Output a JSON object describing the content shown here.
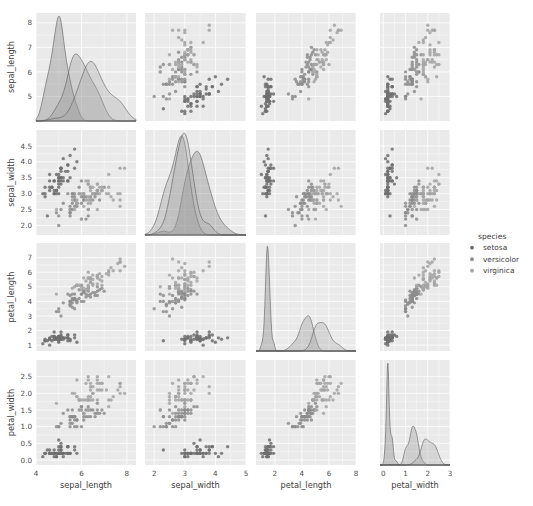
{
  "figure": {
    "type": "pairplot",
    "background": "#ffffff",
    "panel_background": "#eaeaea",
    "grid_color": "#ffffff"
  },
  "legend": {
    "title": "species",
    "position": "right",
    "entries": [
      {
        "label": "setosa",
        "color": "#6e6e6e",
        "marker": "circle"
      },
      {
        "label": "versicolor",
        "color": "#8c8c8c",
        "marker": "circle"
      },
      {
        "label": "virginica",
        "color": "#a3a3a3",
        "marker": "circle"
      }
    ]
  },
  "chart_data": {
    "type": "scatter",
    "title": "",
    "subtitle": "",
    "variables": [
      "sepal_length",
      "sepal_width",
      "petal_length",
      "petal_width"
    ],
    "grid": true,
    "diagonal": "kde",
    "offdiagonal": "scatter",
    "groupby": "species",
    "groups": [
      "setosa",
      "versicolor",
      "virginica"
    ],
    "group_colors": [
      "#6e6e6e",
      "#8c8c8c",
      "#a3a3a3"
    ],
    "axes": {
      "sepal_length": {
        "label": "sepal_length",
        "lim": [
          4.0,
          8.4
        ],
        "ticks": [
          4,
          6,
          8
        ],
        "tick_labels": [
          "4",
          "6",
          "8"
        ],
        "y_ticks": [
          5,
          6,
          7,
          8
        ],
        "y_tick_labels": [
          "5",
          "6",
          "7",
          "8"
        ]
      },
      "sepal_width": {
        "label": "sepal_width",
        "lim": [
          1.7,
          5.0
        ],
        "ticks": [
          2,
          3,
          4,
          5
        ],
        "tick_labels": [
          "2",
          "3",
          "4",
          "5"
        ],
        "y_ticks": [
          2.0,
          2.5,
          3.0,
          3.5,
          4.0,
          4.5
        ],
        "y_tick_labels": [
          "2.0",
          "2.5",
          "3.0",
          "3.5",
          "4.0",
          "4.5"
        ]
      },
      "petal_length": {
        "label": "petal_length",
        "lim": [
          0.6,
          8.0
        ],
        "ticks": [
          2,
          4,
          6,
          8
        ],
        "tick_labels": [
          "2",
          "4",
          "6",
          "8"
        ],
        "y_ticks": [
          1,
          2,
          3,
          4,
          5,
          6,
          7
        ],
        "y_tick_labels": [
          "1",
          "2",
          "3",
          "4",
          "5",
          "6",
          "7"
        ]
      },
      "petal_width": {
        "label": "petal_width",
        "lim": [
          -0.15,
          3.0
        ],
        "ticks": [
          0,
          1,
          2,
          3
        ],
        "tick_labels": [
          "0",
          "1",
          "2",
          "3"
        ],
        "y_ticks": [
          0.0,
          0.5,
          1.0,
          1.5,
          2.0,
          2.5
        ],
        "y_tick_labels": [
          "0.0",
          "0.5",
          "1.0",
          "1.5",
          "2.0",
          "2.5"
        ]
      }
    },
    "xlabel": "",
    "ylabel": "",
    "points": {
      "setosa": [
        [
          5.1,
          3.5,
          1.4,
          0.2
        ],
        [
          4.9,
          3.0,
          1.4,
          0.2
        ],
        [
          4.7,
          3.2,
          1.3,
          0.2
        ],
        [
          4.6,
          3.1,
          1.5,
          0.2
        ],
        [
          5.0,
          3.6,
          1.4,
          0.2
        ],
        [
          5.4,
          3.9,
          1.7,
          0.4
        ],
        [
          4.6,
          3.4,
          1.4,
          0.3
        ],
        [
          5.0,
          3.4,
          1.5,
          0.2
        ],
        [
          4.4,
          2.9,
          1.4,
          0.2
        ],
        [
          4.9,
          3.1,
          1.5,
          0.1
        ],
        [
          5.4,
          3.7,
          1.5,
          0.2
        ],
        [
          4.8,
          3.4,
          1.6,
          0.2
        ],
        [
          4.8,
          3.0,
          1.4,
          0.1
        ],
        [
          4.3,
          3.0,
          1.1,
          0.1
        ],
        [
          5.8,
          4.0,
          1.2,
          0.2
        ],
        [
          5.7,
          4.4,
          1.5,
          0.4
        ],
        [
          5.4,
          3.9,
          1.3,
          0.4
        ],
        [
          5.1,
          3.5,
          1.4,
          0.3
        ],
        [
          5.7,
          3.8,
          1.7,
          0.3
        ],
        [
          5.1,
          3.8,
          1.5,
          0.3
        ],
        [
          5.4,
          3.4,
          1.7,
          0.2
        ],
        [
          5.1,
          3.7,
          1.5,
          0.4
        ],
        [
          4.6,
          3.6,
          1.0,
          0.2
        ],
        [
          5.1,
          3.3,
          1.7,
          0.5
        ],
        [
          4.8,
          3.4,
          1.9,
          0.2
        ],
        [
          5.0,
          3.0,
          1.6,
          0.2
        ],
        [
          5.0,
          3.4,
          1.6,
          0.4
        ],
        [
          5.2,
          3.5,
          1.5,
          0.2
        ],
        [
          5.2,
          3.4,
          1.4,
          0.2
        ],
        [
          4.7,
          3.2,
          1.6,
          0.2
        ],
        [
          4.8,
          3.1,
          1.6,
          0.2
        ],
        [
          5.4,
          3.4,
          1.5,
          0.4
        ],
        [
          5.2,
          4.1,
          1.5,
          0.1
        ],
        [
          5.5,
          4.2,
          1.4,
          0.2
        ],
        [
          4.9,
          3.1,
          1.5,
          0.2
        ],
        [
          5.0,
          3.2,
          1.2,
          0.2
        ],
        [
          5.5,
          3.5,
          1.3,
          0.2
        ],
        [
          4.9,
          3.6,
          1.4,
          0.1
        ],
        [
          4.4,
          3.0,
          1.3,
          0.2
        ],
        [
          5.1,
          3.4,
          1.5,
          0.2
        ],
        [
          5.0,
          3.5,
          1.3,
          0.3
        ],
        [
          4.5,
          2.3,
          1.3,
          0.3
        ],
        [
          4.4,
          3.2,
          1.3,
          0.2
        ],
        [
          5.0,
          3.5,
          1.6,
          0.6
        ],
        [
          5.1,
          3.8,
          1.9,
          0.4
        ],
        [
          4.8,
          3.0,
          1.4,
          0.3
        ],
        [
          5.1,
          3.8,
          1.6,
          0.2
        ],
        [
          4.6,
          3.2,
          1.4,
          0.2
        ],
        [
          5.3,
          3.7,
          1.5,
          0.2
        ],
        [
          5.0,
          3.3,
          1.4,
          0.2
        ]
      ],
      "versicolor": [
        [
          7.0,
          3.2,
          4.7,
          1.4
        ],
        [
          6.4,
          3.2,
          4.5,
          1.5
        ],
        [
          6.9,
          3.1,
          4.9,
          1.5
        ],
        [
          5.5,
          2.3,
          4.0,
          1.3
        ],
        [
          6.5,
          2.8,
          4.6,
          1.5
        ],
        [
          5.7,
          2.8,
          4.5,
          1.3
        ],
        [
          6.3,
          3.3,
          4.7,
          1.6
        ],
        [
          4.9,
          2.4,
          3.3,
          1.0
        ],
        [
          6.6,
          2.9,
          4.6,
          1.3
        ],
        [
          5.2,
          2.7,
          3.9,
          1.4
        ],
        [
          5.0,
          2.0,
          3.5,
          1.0
        ],
        [
          5.9,
          3.0,
          4.2,
          1.5
        ],
        [
          6.0,
          2.2,
          4.0,
          1.0
        ],
        [
          6.1,
          2.9,
          4.7,
          1.4
        ],
        [
          5.6,
          2.9,
          3.6,
          1.3
        ],
        [
          6.7,
          3.1,
          4.4,
          1.4
        ],
        [
          5.6,
          3.0,
          4.5,
          1.5
        ],
        [
          5.8,
          2.7,
          4.1,
          1.0
        ],
        [
          6.2,
          2.2,
          4.5,
          1.5
        ],
        [
          5.6,
          2.5,
          3.9,
          1.1
        ],
        [
          5.9,
          3.2,
          4.8,
          1.8
        ],
        [
          6.1,
          2.8,
          4.0,
          1.3
        ],
        [
          6.3,
          2.5,
          4.9,
          1.5
        ],
        [
          6.1,
          2.8,
          4.7,
          1.2
        ],
        [
          6.4,
          2.9,
          4.3,
          1.3
        ],
        [
          6.6,
          3.0,
          4.4,
          1.4
        ],
        [
          6.8,
          2.8,
          4.8,
          1.4
        ],
        [
          6.7,
          3.0,
          5.0,
          1.7
        ],
        [
          6.0,
          2.9,
          4.5,
          1.5
        ],
        [
          5.7,
          2.6,
          3.5,
          1.0
        ],
        [
          5.5,
          2.4,
          3.8,
          1.1
        ],
        [
          5.5,
          2.4,
          3.7,
          1.0
        ],
        [
          5.8,
          2.7,
          3.9,
          1.2
        ],
        [
          6.0,
          2.7,
          5.1,
          1.6
        ],
        [
          5.4,
          3.0,
          4.5,
          1.5
        ],
        [
          6.0,
          3.4,
          4.5,
          1.6
        ],
        [
          6.7,
          3.1,
          4.7,
          1.5
        ],
        [
          6.3,
          2.3,
          4.4,
          1.3
        ],
        [
          5.6,
          3.0,
          4.1,
          1.3
        ],
        [
          5.5,
          2.5,
          4.0,
          1.3
        ],
        [
          5.5,
          2.6,
          4.4,
          1.2
        ],
        [
          6.1,
          3.0,
          4.6,
          1.4
        ],
        [
          5.8,
          2.6,
          4.0,
          1.2
        ],
        [
          5.0,
          2.3,
          3.3,
          1.0
        ],
        [
          5.6,
          2.7,
          4.2,
          1.3
        ],
        [
          5.7,
          3.0,
          4.2,
          1.2
        ],
        [
          5.7,
          2.9,
          4.2,
          1.3
        ],
        [
          6.2,
          2.9,
          4.3,
          1.3
        ],
        [
          5.1,
          2.5,
          3.0,
          1.1
        ],
        [
          5.7,
          2.8,
          4.1,
          1.3
        ]
      ],
      "virginica": [
        [
          6.3,
          3.3,
          6.0,
          2.5
        ],
        [
          5.8,
          2.7,
          5.1,
          1.9
        ],
        [
          7.1,
          3.0,
          5.9,
          2.1
        ],
        [
          6.3,
          2.9,
          5.6,
          1.8
        ],
        [
          6.5,
          3.0,
          5.8,
          2.2
        ],
        [
          7.6,
          3.0,
          6.6,
          2.1
        ],
        [
          4.9,
          2.5,
          4.5,
          1.7
        ],
        [
          7.3,
          2.9,
          6.3,
          1.8
        ],
        [
          6.7,
          2.5,
          5.8,
          1.8
        ],
        [
          7.2,
          3.6,
          6.1,
          2.5
        ],
        [
          6.5,
          3.2,
          5.1,
          2.0
        ],
        [
          6.4,
          2.7,
          5.3,
          1.9
        ],
        [
          6.8,
          3.0,
          5.5,
          2.1
        ],
        [
          5.7,
          2.5,
          5.0,
          2.0
        ],
        [
          5.8,
          2.8,
          5.1,
          2.4
        ],
        [
          6.4,
          3.2,
          5.3,
          2.3
        ],
        [
          6.5,
          3.0,
          5.5,
          1.8
        ],
        [
          7.7,
          3.8,
          6.7,
          2.2
        ],
        [
          7.7,
          2.6,
          6.9,
          2.3
        ],
        [
          6.0,
          2.2,
          5.0,
          1.5
        ],
        [
          6.9,
          3.2,
          5.7,
          2.3
        ],
        [
          5.6,
          2.8,
          4.9,
          2.0
        ],
        [
          7.7,
          2.8,
          6.7,
          2.0
        ],
        [
          6.3,
          2.7,
          4.9,
          1.8
        ],
        [
          6.7,
          3.3,
          5.7,
          2.1
        ],
        [
          7.2,
          3.2,
          6.0,
          1.8
        ],
        [
          6.2,
          2.8,
          4.8,
          1.8
        ],
        [
          6.1,
          3.0,
          4.9,
          1.8
        ],
        [
          6.4,
          2.8,
          5.6,
          2.1
        ],
        [
          7.2,
          3.0,
          5.8,
          1.6
        ],
        [
          7.4,
          2.8,
          6.1,
          1.9
        ],
        [
          7.9,
          3.8,
          6.4,
          2.0
        ],
        [
          6.4,
          2.8,
          5.6,
          2.2
        ],
        [
          6.3,
          2.8,
          5.1,
          1.5
        ],
        [
          6.1,
          2.6,
          5.6,
          1.4
        ],
        [
          7.7,
          3.0,
          6.1,
          2.3
        ],
        [
          6.3,
          3.4,
          5.6,
          2.4
        ],
        [
          6.4,
          3.1,
          5.5,
          1.8
        ],
        [
          6.0,
          3.0,
          4.8,
          1.8
        ],
        [
          6.9,
          3.1,
          5.4,
          2.1
        ],
        [
          6.7,
          3.1,
          5.6,
          2.4
        ],
        [
          6.9,
          3.1,
          5.1,
          2.3
        ],
        [
          5.8,
          2.7,
          5.1,
          1.9
        ],
        [
          6.8,
          3.2,
          5.9,
          2.3
        ],
        [
          6.7,
          3.3,
          5.7,
          2.5
        ],
        [
          6.7,
          3.0,
          5.2,
          2.3
        ],
        [
          6.3,
          2.5,
          5.0,
          1.9
        ],
        [
          6.5,
          3.0,
          5.2,
          2.0
        ],
        [
          6.2,
          3.4,
          5.4,
          2.3
        ],
        [
          5.9,
          3.0,
          5.1,
          1.8
        ]
      ]
    }
  }
}
